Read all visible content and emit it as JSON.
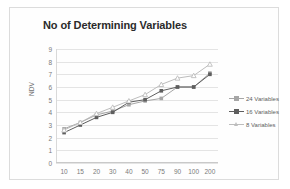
{
  "chart_data": {
    "type": "line",
    "title": "No of Determining Variables",
    "xlabel": "",
    "ylabel": "NDV",
    "categories": [
      "10",
      "15",
      "20",
      "30",
      "40",
      "50",
      "75",
      "90",
      "100",
      "200"
    ],
    "ylim": [
      0,
      9
    ],
    "yticks": [
      "0",
      "1",
      "2",
      "3",
      "4",
      "5",
      "6",
      "7",
      "8",
      "9"
    ],
    "grid": true,
    "legend_position": "right",
    "series": [
      {
        "name": "24 Variables",
        "color": "#a6a6a6",
        "marker": "square",
        "values": [
          2.7,
          3.2,
          3.8,
          4.1,
          4.6,
          4.9,
          5.1,
          6.0,
          6.0,
          7.1
        ]
      },
      {
        "name": "16 Variables",
        "color": "#5e5e5e",
        "marker": "square",
        "values": [
          2.4,
          3.0,
          3.6,
          4.0,
          4.8,
          5.0,
          5.7,
          6.0,
          6.0,
          7.0
        ]
      },
      {
        "name": "8 Variables",
        "color": "#bdbdbd",
        "marker": "triangle",
        "values": [
          2.6,
          3.2,
          3.9,
          4.4,
          4.9,
          5.4,
          6.2,
          6.7,
          6.9,
          7.8
        ]
      }
    ]
  }
}
